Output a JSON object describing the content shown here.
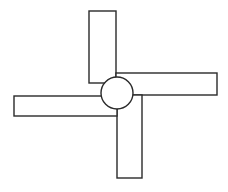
{
  "diagram": {
    "title": "",
    "type": "pinwheel",
    "stroke_color": "#2a2a2a",
    "fill_color": "#ffffff",
    "background": "#ffffff",
    "hub": {
      "cx": 117,
      "cy": 93,
      "r": 16
    },
    "blades": [
      {
        "name": "top",
        "x": 89,
        "y": 11,
        "w": 27,
        "h": 72
      },
      {
        "name": "right",
        "x": 116,
        "y": 73,
        "w": 101,
        "h": 22
      },
      {
        "name": "bottom",
        "x": 117,
        "y": 95,
        "w": 25,
        "h": 83
      },
      {
        "name": "left",
        "x": 14,
        "y": 96,
        "w": 103,
        "h": 20
      }
    ]
  }
}
